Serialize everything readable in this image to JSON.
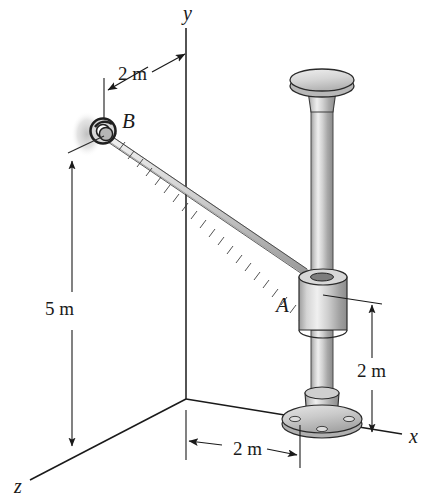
{
  "figure": {
    "background_color": "#ffffff",
    "line_color": "#1a1a1a"
  },
  "axes": [
    {
      "name": "y-axis",
      "label": "y",
      "label_x": 183,
      "label_y": 20,
      "x1": 186,
      "y1": 28,
      "x2": 186,
      "y2": 399
    },
    {
      "name": "x-axis",
      "label": "x",
      "label_x": 409,
      "label_y": 443,
      "x1": 186,
      "y1": 399,
      "x2": 402,
      "y2": 434
    },
    {
      "name": "z-axis",
      "label": "z",
      "label_x": 14,
      "label_y": 493,
      "x1": 186,
      "y1": 399,
      "x2": 30,
      "y2": 480
    }
  ],
  "points": [
    {
      "name": "point-a",
      "label": "A",
      "label_x": 276,
      "label_y": 312,
      "x": 320,
      "y": 290,
      "description": "collar on post"
    },
    {
      "name": "point-b",
      "label": "B",
      "label_x": 122,
      "label_y": 128,
      "x": 103,
      "y": 131,
      "description": "eye-bolt on wall"
    }
  ],
  "dimensions": [
    {
      "name": "dim-top-2m",
      "label": "2 m",
      "text_x": 118,
      "text_y": 80,
      "orientation": "diagonal",
      "description": "horizontal offset of B from y-axis"
    },
    {
      "name": "dim-left-5m",
      "label": "5 m",
      "text_x": 45,
      "text_y": 315,
      "orientation": "vertical",
      "description": "height of B above z-axis ground line"
    },
    {
      "name": "dim-bottom-2m",
      "label": "2 m",
      "text_x": 233,
      "text_y": 455,
      "orientation": "horizontal",
      "description": "offset of post base along x"
    },
    {
      "name": "dim-right-2m",
      "label": "2 m",
      "text_x": 357,
      "text_y": 377,
      "orientation": "vertical",
      "description": "height of collar A above post base"
    }
  ],
  "objects": [
    {
      "name": "post",
      "type": "cylinder",
      "description": "vertical gray post"
    },
    {
      "name": "post-cap",
      "type": "disc",
      "description": "mushroom cap on top of post"
    },
    {
      "name": "collar-a",
      "type": "cylinder",
      "description": "sliding collar at point A"
    },
    {
      "name": "base-flange",
      "type": "flange",
      "description": "bolted base plate of post"
    },
    {
      "name": "rope",
      "type": "cable",
      "description": "twisted rope from A to B"
    },
    {
      "name": "eye-bolt",
      "type": "ring",
      "description": "eye-bolt anchor at B"
    },
    {
      "name": "wall-patch",
      "type": "shadow",
      "description": "gray wall smudge behind eye-bolt"
    }
  ],
  "colors": {
    "metal_light": "#e8e8e8",
    "metal_mid": "#c2c2c2",
    "metal_dark": "#8f8f8f",
    "outline": "#1a1a1a",
    "shadow": "#c8c8c8"
  }
}
